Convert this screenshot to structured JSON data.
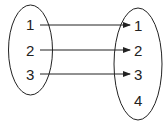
{
  "diagram": {
    "type": "mapping",
    "domain": {
      "labels": [
        "1",
        "2",
        "3"
      ]
    },
    "codomain": {
      "labels": [
        "1",
        "2",
        "3",
        "4"
      ]
    },
    "arrows": [
      {
        "from": "1",
        "to": "1"
      },
      {
        "from": "2",
        "to": "2"
      },
      {
        "from": "3",
        "to": "3"
      }
    ],
    "colors": {
      "stroke": "#222222",
      "background": "#ffffff"
    }
  }
}
